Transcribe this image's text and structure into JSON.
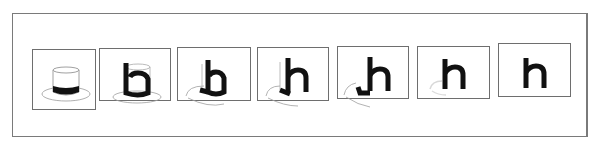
{
  "figure": {
    "title": "",
    "frames": [
      {
        "index": 1,
        "label": "",
        "content": "top-hat",
        "glyph": ""
      },
      {
        "index": 2,
        "label": "",
        "content": "hat-to-h-morph-stage-1",
        "glyph": "h"
      },
      {
        "index": 3,
        "label": "",
        "content": "hat-to-h-morph-stage-2",
        "glyph": "h"
      },
      {
        "index": 4,
        "label": "",
        "content": "hat-to-h-morph-stage-3",
        "glyph": "h"
      },
      {
        "index": 5,
        "label": "",
        "content": "hat-to-h-morph-stage-4",
        "glyph": "h"
      },
      {
        "index": 6,
        "label": "",
        "content": "hat-to-h-morph-stage-5",
        "glyph": "h"
      },
      {
        "index": 7,
        "label": "",
        "content": "letter-h",
        "glyph": "h"
      }
    ],
    "colors": {
      "frame_border": "#6e6e6e",
      "ink": "#111111",
      "hat_outline": "#9a9a9a",
      "background": "#ffffff"
    }
  }
}
